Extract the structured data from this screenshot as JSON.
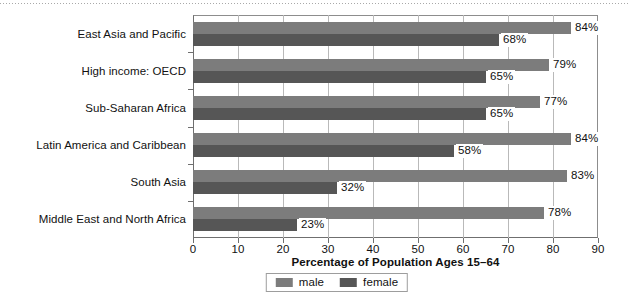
{
  "chart_data": {
    "type": "bar",
    "orientation": "horizontal",
    "title": "",
    "xlabel": "Percentage of Population Ages 15–64",
    "ylabel": "",
    "xlim": [
      0,
      90
    ],
    "xticks": [
      0,
      10,
      20,
      30,
      40,
      50,
      60,
      70,
      80,
      90
    ],
    "xtick_labels": [
      "0",
      "10",
      "20",
      "30",
      "40",
      "50",
      "60",
      "70",
      "80",
      "90"
    ],
    "grid": true,
    "grid_axis": "x",
    "legend_position": "bottom-center",
    "categories": [
      "East Asia and Pacific",
      "High income: OECD",
      "Sub-Saharan Africa",
      "Latin America and Caribbean",
      "South Asia",
      "Middle East and North Africa"
    ],
    "series": [
      {
        "name": "male",
        "color": "#7c7c7c",
        "values": [
          84,
          79,
          77,
          84,
          83,
          78
        ],
        "data_labels": [
          "84%",
          "79%",
          "77%",
          "84%",
          "83%",
          "78%"
        ]
      },
      {
        "name": "female",
        "color": "#565656",
        "values": [
          68,
          65,
          65,
          58,
          32,
          23
        ],
        "data_labels": [
          "68%",
          "65%",
          "65%",
          "58%",
          "32%",
          "23%"
        ]
      }
    ]
  },
  "legend": {
    "entries": [
      {
        "label": "male",
        "swatch": "male-color-swatch"
      },
      {
        "label": "female",
        "swatch": "female-color-swatch"
      }
    ]
  },
  "axis_title": "Percentage of Population Ages 15–64"
}
